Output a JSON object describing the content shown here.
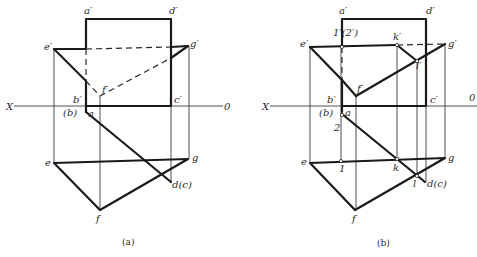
{
  "figure": {
    "panels": [
      {
        "caption": "(a)",
        "axis": {
          "left_label": "X",
          "right_label": "0"
        },
        "labels": {
          "a_prime": "a′",
          "d_prime": "d′",
          "e_prime": "e′",
          "g_prime": "g′",
          "f_prime": "f′",
          "b_prime": "b′",
          "b_paren": "(b)",
          "a": "a",
          "c_prime": "c′",
          "e": "e",
          "g": "g",
          "f": "f",
          "d_c": "d(c)"
        }
      },
      {
        "caption": "(b)",
        "axis": {
          "left_label": "X",
          "right_label": "0"
        },
        "labels": {
          "a_prime": "a′",
          "d_prime": "d′",
          "one_two_prime": "1′(2′)",
          "k_prime": "k′",
          "e_prime": "e′",
          "g_prime": "g′",
          "l_prime": "l′",
          "f_prime": "f′",
          "b_prime": "b′",
          "b_paren": "(b)",
          "a": "a",
          "c_prime": "c′",
          "two": "2",
          "e": "e",
          "one": "1",
          "k": "k",
          "g": "g",
          "l": "l",
          "d_c": "d(c)",
          "f": "f"
        }
      }
    ]
  }
}
